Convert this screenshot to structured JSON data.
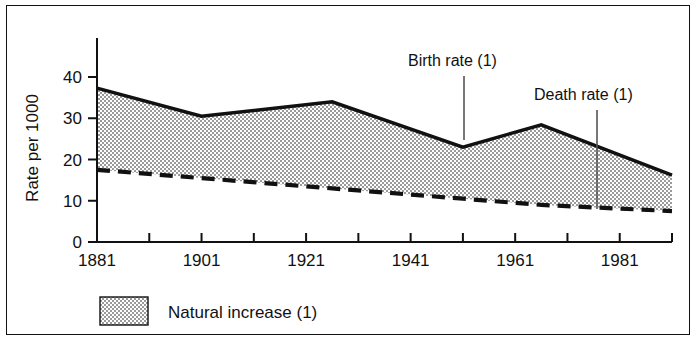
{
  "chart_data": {
    "type": "area",
    "title": "",
    "xlabel": "",
    "ylabel": "Rate per 1000",
    "xlim": [
      1881,
      1991
    ],
    "ylim": [
      0,
      47
    ],
    "ytick_values": [
      0,
      10,
      20,
      30,
      40
    ],
    "ytick_labels": [
      "0",
      "10",
      "20",
      "30",
      "40"
    ],
    "xtick_values": [
      1881,
      1891,
      1901,
      1911,
      1921,
      1931,
      1941,
      1951,
      1961,
      1971,
      1981,
      1991
    ],
    "xtick_labels": [
      "1881",
      "",
      "1901",
      "",
      "1921",
      "",
      "1941",
      "",
      "1961",
      "",
      "1981",
      ""
    ],
    "xtick_labeled": [
      {
        "value": 1881,
        "label": "1881"
      },
      {
        "value": 1901,
        "label": "1901"
      },
      {
        "value": 1921,
        "label": "1921"
      },
      {
        "value": 1941,
        "label": "1941"
      },
      {
        "value": 1961,
        "label": "1961"
      },
      {
        "value": 1981,
        "label": "1981"
      }
    ],
    "grid": false,
    "legend_position": "below-left",
    "x": [
      1881,
      1901,
      1926,
      1951,
      1966,
      1991
    ],
    "series": [
      {
        "name": "Birth rate (1)",
        "style": "solid",
        "values": [
          37.3,
          30.5,
          34.0,
          23.0,
          28.4,
          16.2
        ]
      },
      {
        "name": "Death rate (1)",
        "style": "dashed",
        "values": [
          17.5,
          15.5,
          13.0,
          10.5,
          9.0,
          7.5
        ]
      }
    ],
    "fill_between": {
      "name": "Natural increase (1)",
      "upper": "Birth rate (1)",
      "lower": "Death rate (1)",
      "pattern": "stipple"
    },
    "annotations": [
      {
        "text": "Birth rate (1)",
        "target_x": 1951,
        "target_series": "Birth rate (1)"
      },
      {
        "text": "Death rate (1)",
        "target_x": 1978,
        "target_series": "Death rate (1)"
      }
    ],
    "colors": {
      "line": "#111111",
      "fill": "#e2e2e2",
      "frame": "#111111",
      "text": "#111111"
    }
  },
  "axis": {
    "y_title": "Rate per 1000",
    "y_ticks": [
      "40",
      "30",
      "20",
      "10",
      "0"
    ],
    "x_ticks": [
      "1881",
      "1901",
      "1921",
      "1941",
      "1961",
      "1981"
    ]
  },
  "annotations": {
    "birth_rate": "Birth rate (1)",
    "death_rate": "Death rate (1)"
  },
  "legend": {
    "swatch_label": "Natural increase (1)"
  }
}
